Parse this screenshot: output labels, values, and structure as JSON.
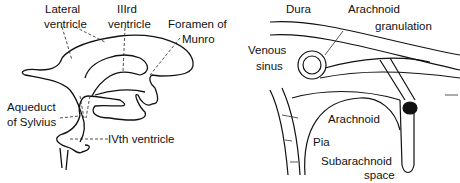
{
  "figures": [
    {
      "id": "ventricular-system",
      "labels": {
        "lateral_ventricle_1": "Lateral",
        "lateral_ventricle_2": "ventricle",
        "third_ventricle_1": "IIIrd",
        "third_ventricle_2": "ventricle",
        "foramen_1": "Foramen of",
        "foramen_2": "Munro",
        "aqueduct_1": "Aqueduct",
        "aqueduct_2": "of Sylvius",
        "fourth_ventricle": "IVth ventricle"
      }
    },
    {
      "id": "meninges",
      "labels": {
        "dura": "Dura",
        "granulation_1": "Arachnoid",
        "granulation_2": "granulation",
        "venous_1": "Venous",
        "venous_2": "sinus",
        "arachnoid": "Arachnoid",
        "pia": "Pia",
        "subarachnoid_1": "Subarachnoid",
        "subarachnoid_2": "space"
      }
    }
  ]
}
